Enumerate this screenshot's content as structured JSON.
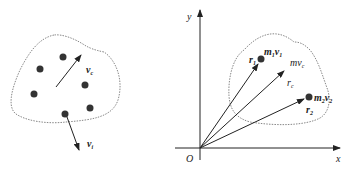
{
  "left_figure": {
    "velocity_center_label": "v",
    "velocity_center_sub": "c",
    "velocity_particle_label": "v",
    "velocity_particle_sub": "i"
  },
  "right_figure": {
    "axis_y_label": "y",
    "axis_x_label": "x",
    "origin_label": "O",
    "particle1_label": "m",
    "particle1_m_sub": "1",
    "particle1_v": "v",
    "particle1_v_sub": "1",
    "r1_label": "r",
    "r1_sub": "1",
    "center_label": "mv",
    "center_sub": "c",
    "rc_label": "r",
    "rc_sub": "c",
    "particle2_label": "m",
    "particle2_m_sub": "2",
    "particle2_v": "v",
    "particle2_v_sub": "2",
    "r2_label": "r",
    "r2_sub": "2"
  },
  "colors": {
    "ink": "#222222",
    "dotted": "#888888"
  }
}
